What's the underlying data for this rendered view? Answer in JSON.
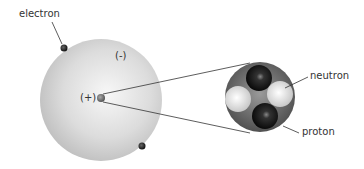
{
  "diagram": {
    "labels": {
      "electron": "electron",
      "negative_charge": "(-)",
      "positive_charge": "(+)",
      "neutron": "neutron",
      "proton": "proton"
    },
    "colors": {
      "atom_sphere": "#d8d8d8",
      "electron": "#1a1a1a",
      "proton": "#111111",
      "neutron": "#e8e8e8",
      "nucleus_shell": "#6a6a6a",
      "line": "#333333"
    }
  }
}
